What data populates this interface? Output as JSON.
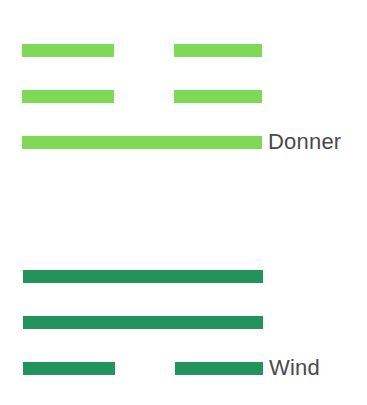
{
  "trigrams": [
    {
      "name": "Donner",
      "color": "#7ed957",
      "lines": [
        "broken",
        "broken",
        "solid"
      ]
    },
    {
      "name": "Wind",
      "color": "#22935a",
      "lines": [
        "solid",
        "solid",
        "broken"
      ]
    }
  ]
}
